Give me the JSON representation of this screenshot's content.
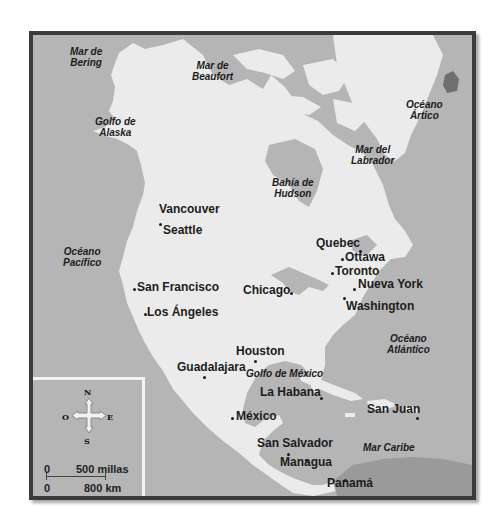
{
  "map": {
    "title": "North America political map",
    "colors": {
      "sea": "#b5b5b5",
      "land": "#ebebeb",
      "border": "#3b3b3b",
      "text": "#1c1c1c"
    },
    "water_labels": [
      {
        "id": "mar-de-bering",
        "line1": "Mar de",
        "line2": "Bering"
      },
      {
        "id": "mar-de-beaufort",
        "line1": "Mar de",
        "line2": "Beaufort"
      },
      {
        "id": "oceano-artico",
        "line1": "Océano",
        "line2": "Ártico"
      },
      {
        "id": "golfo-de-alaska",
        "line1": "Golfo de",
        "line2": "Alaska"
      },
      {
        "id": "mar-del-labrador",
        "line1": "Mar del",
        "line2": "Labrador"
      },
      {
        "id": "bahia-de-hudson",
        "line1": "Bahía de",
        "line2": "Hudson"
      },
      {
        "id": "oceano-pacifico",
        "line1": "Océano",
        "line2": "Pacífico"
      },
      {
        "id": "oceano-atlantico",
        "line1": "Océano",
        "line2": "Atlántico"
      },
      {
        "id": "golfo-de-mexico",
        "line1": "Golfo de México"
      },
      {
        "id": "mar-caribe",
        "line1": "Mar Caribe"
      }
    ],
    "cities": [
      {
        "name": "Vancouver"
      },
      {
        "name": "Seattle"
      },
      {
        "name": "San Francisco"
      },
      {
        "name": "Los Ángeles"
      },
      {
        "name": "Chicago"
      },
      {
        "name": "Quebec"
      },
      {
        "name": "Ottawa"
      },
      {
        "name": "Toronto"
      },
      {
        "name": "Nueva York"
      },
      {
        "name": "Washington"
      },
      {
        "name": "Houston"
      },
      {
        "name": "Guadalajara"
      },
      {
        "name": "La Habana"
      },
      {
        "name": "México"
      },
      {
        "name": "San Juan"
      },
      {
        "name": "San Salvador"
      },
      {
        "name": "Managua"
      },
      {
        "name": "Panamá"
      }
    ],
    "legend": {
      "compass": {
        "north": "N",
        "south": "S",
        "east": "E",
        "west": "O"
      },
      "scale": {
        "zero_top": "0",
        "miles_label": "500 millas",
        "zero_bottom": "0",
        "km_label": "800 km"
      }
    }
  }
}
